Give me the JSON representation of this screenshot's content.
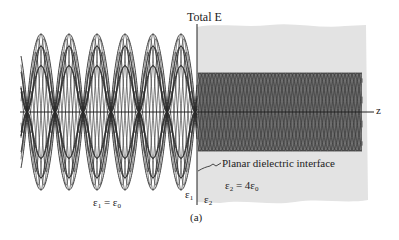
{
  "figure": {
    "axis_title": "Total E",
    "axis_z": "z",
    "interface_label": "Planar dielectric interface",
    "region1": {
      "symbol": "ε",
      "sub": "1",
      "eq": " = ε",
      "eq_sub": "0"
    },
    "region1_short": {
      "symbol": "ε",
      "sub": "1"
    },
    "region2": {
      "symbol": "ε",
      "sub": "2",
      "eq": " = 4ε",
      "eq_sub": "0"
    },
    "region2_short": {
      "symbol": "ε",
      "sub": "2"
    },
    "caption": "(a)",
    "colors": {
      "line": "#2a2a2a",
      "dielectric_fill": "#e3e3e3",
      "background": "#ffffff"
    },
    "wave_left": {
      "lobes": 6,
      "lobe_width_px": 28,
      "amplitude_px": 78,
      "traces": 5
    },
    "wave_right": {
      "lobe_width_px": 7,
      "amplitude_px": 39,
      "traces": 5
    }
  }
}
